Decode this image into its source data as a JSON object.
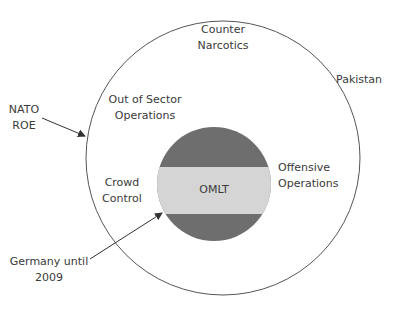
{
  "diagram": {
    "type": "nested-circles",
    "outer_circle": {
      "label_lines": [
        "Counter",
        "Narcotics"
      ]
    },
    "inner_circle": {
      "label": "OMLT",
      "band_colors": {
        "dark": "#6e6e6e",
        "light": "#d5d5d5"
      }
    },
    "zones": [
      {
        "id": "out-of-sector",
        "lines": [
          "Out of Sector",
          "Operations"
        ]
      },
      {
        "id": "crowd-control",
        "lines": [
          "Crowd",
          "Control"
        ]
      },
      {
        "id": "offensive",
        "lines": [
          "Offensive",
          "Operations"
        ]
      }
    ],
    "external_labels": [
      {
        "id": "pakistan",
        "lines": [
          "Pakistan"
        ]
      },
      {
        "id": "nato-roe",
        "lines": [
          "NATO",
          "ROE"
        ]
      },
      {
        "id": "germany",
        "lines": [
          "Germany until",
          "2009"
        ]
      }
    ],
    "colors": {
      "stroke": "#555555",
      "text": "#3a3a3a"
    }
  }
}
